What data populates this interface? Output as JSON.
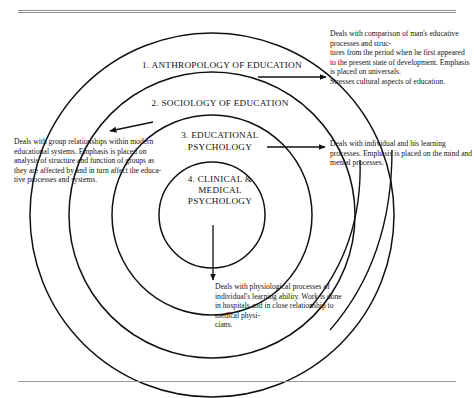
{
  "figure": {
    "title_present": false,
    "rings": [
      {
        "id": "anthropology",
        "number": "1.",
        "label": "1. ANTHROPOLOGY OF EDUCATION",
        "description": "Deals with comparison of man's educative processes and struc-\ntures from the period when he first appeared to the present state of development. Emphasis is placed on universals.\nStresses cultural aspects of education.",
        "arrow_direction": "right"
      },
      {
        "id": "sociology",
        "number": "2.",
        "label": "2. SOCIOLOGY OF EDUCATION",
        "description": "Deals with group relationships within modern educational systems. Emphasis is placed on analysis of structure and function of groups as they are affected by and in turn affect the educa-\ntive processes and systems.",
        "arrow_direction": "left"
      },
      {
        "id": "educational-psychology",
        "number": "3.",
        "label": "3. EDUCATIONAL\nPSYCHOLOGY",
        "description": "Deals with individual and his learning processes. Emphasis is placed on the mind and mental processes.",
        "arrow_direction": "right"
      },
      {
        "id": "clinical-medical-psychology",
        "number": "4.",
        "label": "4. CLINICAL &\nMEDICAL\nPSYCHOLOGY",
        "description": "Deals with physiological processes of individual's learning ability. Work is done in hospitals and in close relationship to medical physi-\ncians.",
        "arrow_direction": "down"
      }
    ],
    "colors": {
      "ink": "#111111",
      "rule": "#8d8d8d",
      "background": "#ffffff"
    }
  }
}
